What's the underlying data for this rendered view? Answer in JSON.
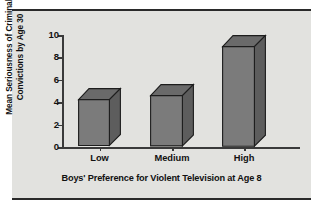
{
  "chart_data": {
    "type": "bar",
    "title": "",
    "subtitle": "",
    "xlabel": "Boys' Preference for Violent Television at Age 8",
    "ylabel_line1": "Mean Seriousness of Criminal",
    "ylabel_line2": "Convictions by Age 30",
    "categories": [
      "Low",
      "Medium",
      "High"
    ],
    "values": [
      4.2,
      4.6,
      9.0
    ],
    "ylim": [
      0,
      10
    ],
    "ytick_labels": [
      "0",
      "2",
      "4",
      "6",
      "8",
      "10"
    ],
    "ytick_values": [
      0,
      2,
      4,
      6,
      8,
      10
    ],
    "grid": false,
    "legend": "none",
    "style": "3d-bar",
    "colors": {
      "bar_front": "#7b7b7b",
      "bar_side": "#5d5d5d",
      "bar_top": "#6a6a6a",
      "bar_outline": "#1d1d1d",
      "panel_background": "#e2e2df",
      "axis": "#3a3a3a",
      "text": "#111111",
      "rule": "#2a2a2a"
    }
  },
  "figure": {
    "top_rule": "",
    "bottom_rule": ""
  }
}
